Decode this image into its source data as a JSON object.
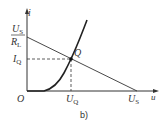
{
  "diagram": {
    "type": "diode operating point (load line)",
    "caption": "b)",
    "axes": {
      "x_label": "u",
      "y_label": "i",
      "origin_label": "O"
    },
    "labels": {
      "y_intercept_num": "U",
      "y_intercept_num_sub": "S",
      "y_intercept_den": "R",
      "y_intercept_den_sub": "L",
      "iq": "I",
      "iq_sub": "Q",
      "uq": "U",
      "uq_sub": "Q",
      "us": "U",
      "us_sub": "S",
      "q_point": "Q"
    },
    "colors": {
      "stroke": "#333333",
      "background": "#ffffff"
    }
  }
}
